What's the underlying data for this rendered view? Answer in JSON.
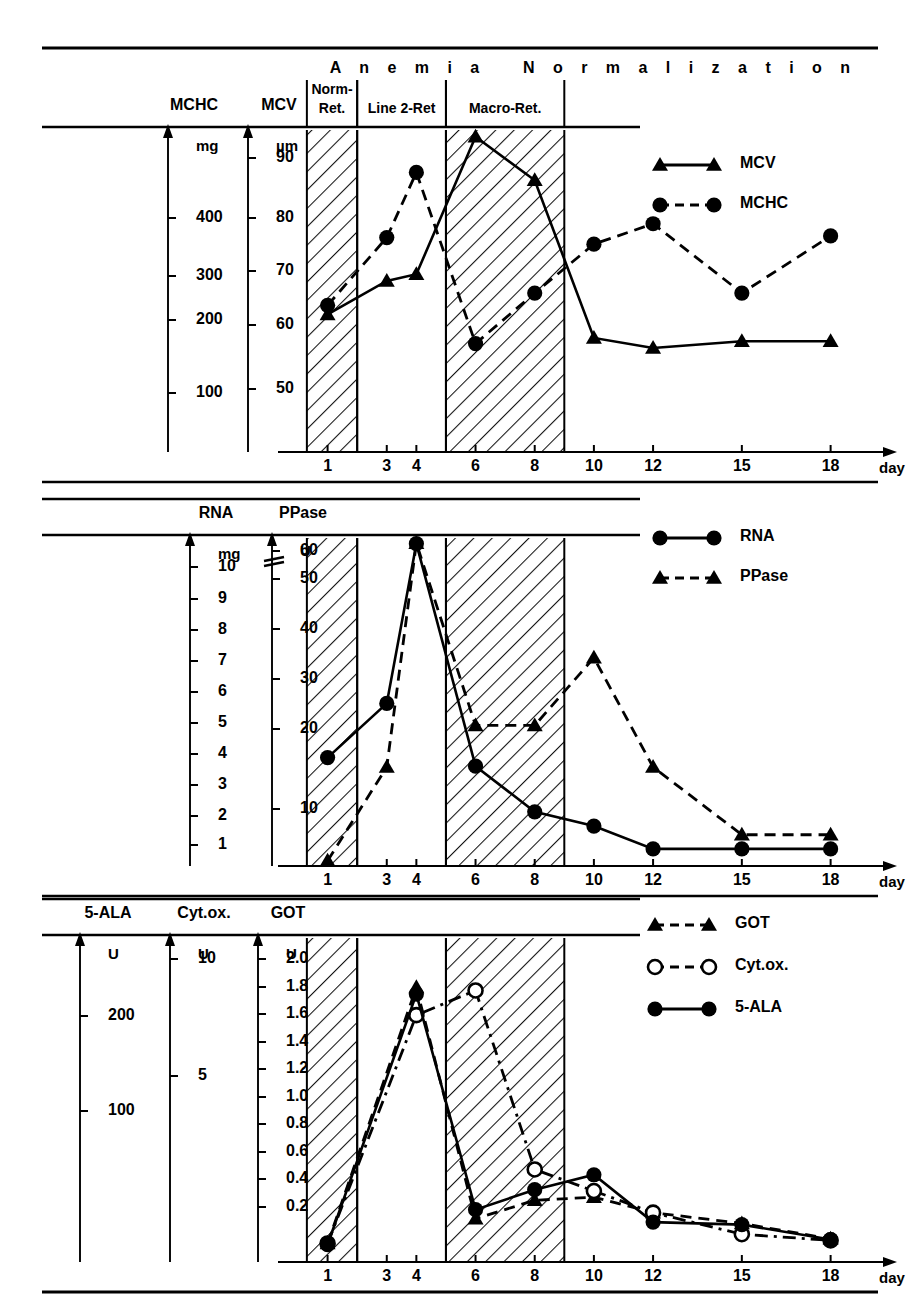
{
  "figure": {
    "phases": [
      {
        "id": "anemia",
        "label": "A n e m i a"
      },
      {
        "id": "normalization",
        "label": "N o r m a l i z a t i o n"
      }
    ],
    "bands": [
      {
        "id": "norm-ret",
        "label_line1": "Norm-",
        "label_line2": "Ret.",
        "hatched": true,
        "x_from_day": 0.3,
        "x_to_day": 2.0
      },
      {
        "id": "line2-ret",
        "label_line1": "Line 2-Ret",
        "label_line2": "",
        "hatched": false,
        "x_from_day": 2.0,
        "x_to_day": 5.0
      },
      {
        "id": "macro-ret",
        "label_line1": "Macro-Ret.",
        "label_line2": "",
        "hatched": true,
        "x_from_day": 5.0,
        "x_to_day": 9.0
      }
    ],
    "x_axis": {
      "label": "day",
      "ticks": [
        1,
        3,
        4,
        6,
        8,
        10,
        12,
        15,
        18
      ]
    }
  },
  "panels": [
    {
      "id": "panel-1",
      "axes": [
        {
          "id": "mchc-axis",
          "name": "MCHC",
          "unit": "mg",
          "ticks": [
            "400",
            "300",
            "200",
            "100"
          ]
        },
        {
          "id": "mcv-axis",
          "name": "MCV",
          "unit": "µm",
          "ticks": [
            "90",
            "80",
            "70",
            "60",
            "50"
          ]
        }
      ],
      "legend": [
        {
          "id": "legend-mcv",
          "label": "MCV",
          "marker": "triangle-filled",
          "line": "solid"
        },
        {
          "id": "legend-mchc",
          "label": "MCHC",
          "marker": "circle-filled",
          "line": "dashed"
        }
      ]
    },
    {
      "id": "panel-2",
      "axes": [
        {
          "id": "rna-axis",
          "name": "RNA",
          "unit": "mg",
          "ticks": [
            "10",
            "9",
            "8",
            "7",
            "6",
            "5",
            "4",
            "3",
            "2",
            "1"
          ]
        },
        {
          "id": "ppase-axis",
          "name": "PPase",
          "unit": "U",
          "ticks": [
            "60",
            "50",
            "40",
            "30",
            "20",
            "10"
          ]
        }
      ],
      "legend": [
        {
          "id": "legend-rna",
          "label": "RNA",
          "marker": "circle-filled",
          "line": "solid"
        },
        {
          "id": "legend-ppase",
          "label": "PPase",
          "marker": "triangle-filled",
          "line": "dashed"
        }
      ]
    },
    {
      "id": "panel-3",
      "axes": [
        {
          "id": "ala-axis",
          "name": "5-ALA",
          "unit": "U",
          "ticks": [
            "200",
            "100"
          ]
        },
        {
          "id": "cytox-axis",
          "name": "Cyt.ox.",
          "unit": "U",
          "ticks": [
            "10",
            "5"
          ]
        },
        {
          "id": "got-axis",
          "name": "GOT",
          "unit": "U",
          "ticks": [
            "2.0",
            "1.8",
            "1.6",
            "1.4",
            "1.2",
            "1.0",
            "0.8",
            "0.6",
            "0.4",
            "0.2"
          ]
        }
      ],
      "legend": [
        {
          "id": "legend-got",
          "label": "GOT",
          "marker": "triangle-filled",
          "line": "dashed"
        },
        {
          "id": "legend-cytox",
          "label": "Cyt.ox.",
          "marker": "circle-open",
          "line": "dashdot"
        },
        {
          "id": "legend-ala",
          "label": "5-ALA",
          "marker": "circle-filled",
          "line": "solid"
        }
      ]
    }
  ],
  "chart_data": [
    {
      "type": "line",
      "title": "MCHC / MCV",
      "xlabel": "day",
      "ylabel": "MCHC (mg) / MCV (µm)",
      "x": [
        1,
        3,
        4,
        6,
        8,
        10,
        12,
        15,
        18
      ],
      "xlim": [
        0,
        19.5
      ],
      "grid": false,
      "legend_position": "right",
      "series": [
        {
          "name": "MCV",
          "unit": "µm",
          "ylim": [
            45,
            93
          ],
          "values": [
            65.5,
            70.5,
            71.5,
            92.0,
            85.5,
            62.0,
            60.5,
            61.5,
            61.5
          ]
        },
        {
          "name": "MCHC",
          "unit": "mg",
          "ylim": [
            55,
            450
          ],
          "values": [
            235,
            318,
            398,
            188,
            250,
            310,
            335,
            250,
            320
          ]
        }
      ]
    },
    {
      "type": "line",
      "title": "RNA / PPase",
      "xlabel": "day",
      "ylabel": "RNA (mg) / PPase (U)",
      "x": [
        1,
        3,
        4,
        6,
        8,
        10,
        12,
        15,
        18
      ],
      "xlim": [
        0,
        19.5
      ],
      "grid": false,
      "legend_position": "right",
      "series": [
        {
          "name": "RNA",
          "unit": "mg",
          "ylim": [
            0,
            11.5
          ],
          "values": [
            3.8,
            5.7,
            11.3,
            3.5,
            1.9,
            1.4,
            0.6,
            0.6,
            0.6
          ]
        },
        {
          "name": "PPase",
          "unit": "U",
          "ylim": [
            0,
            63
          ],
          "values": [
            1.0,
            19.0,
            62.0,
            27.0,
            27.0,
            40.0,
            19.0,
            6.0,
            6.0
          ]
        }
      ]
    },
    {
      "type": "line",
      "title": "5-ALA / Cyt.ox. / GOT",
      "xlabel": "day",
      "ylabel": "5-ALA (U) / Cyt.ox. (U) / GOT (U)",
      "x": [
        1,
        4,
        6,
        8,
        10,
        12,
        15,
        18
      ],
      "xlim": [
        0,
        19.5
      ],
      "grid": false,
      "legend_position": "right",
      "series": [
        {
          "name": "GOT",
          "unit": "U",
          "ylim": [
            0,
            2.1
          ],
          "values": [
            0.12,
            1.78,
            0.28,
            0.4,
            0.42,
            0.32,
            0.25,
            0.15
          ]
        },
        {
          "name": "Cyt.ox.",
          "unit": "U",
          "ylim": [
            0,
            10.5
          ],
          "values": [
            0.6,
            8.0,
            8.8,
            3.0,
            2.3,
            1.6,
            0.9,
            0.7
          ]
        },
        {
          "name": "5-ALA",
          "unit": "U",
          "ylim": [
            0,
            260
          ],
          "values": [
            14,
            215,
            42,
            58,
            70,
            32,
            30,
            18
          ]
        }
      ]
    }
  ]
}
